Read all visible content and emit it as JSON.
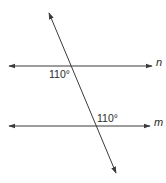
{
  "diagram": {
    "type": "parallel-lines-cut-by-transversal",
    "colors": {
      "stroke": "#3a3a3a",
      "text": "#2a2a2a",
      "background": "#ffffff"
    },
    "lines": [
      {
        "id": "n",
        "label": "n",
        "kind": "horizontal",
        "y": 66,
        "x1": 9,
        "x2": 152
      },
      {
        "id": "m",
        "label": "m",
        "kind": "horizontal",
        "y": 126,
        "x1": 9,
        "x2": 150
      }
    ],
    "transversal": {
      "x1": 49,
      "y1": 13,
      "x2": 116,
      "y2": 173
    },
    "angles": [
      {
        "at_line": "n",
        "text": "110°",
        "position": "below-left of intersection"
      },
      {
        "at_line": "m",
        "text": "110°",
        "position": "above-right of intersection"
      }
    ]
  }
}
